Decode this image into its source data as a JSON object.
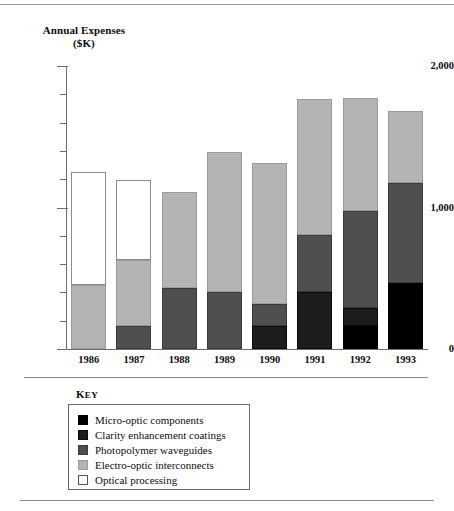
{
  "chart_data": {
    "type": "bar",
    "subtype": "stacked",
    "title": "Annual Expenses",
    "title_line2": "($K)",
    "ylabel": "Annual Expenses ($K)",
    "xlabel": "",
    "categories": [
      "1986",
      "1987",
      "1988",
      "1989",
      "1990",
      "1991",
      "1992",
      "1993"
    ],
    "ylim": [
      0,
      2000
    ],
    "ytick_labels": [
      "0",
      "1,000",
      "2,000"
    ],
    "ytick_values": [
      0,
      1000,
      2000
    ],
    "yminor_step": 200,
    "grid": false,
    "legend_position": "below-chart",
    "legend_title": "Key",
    "series": [
      {
        "name": "Optical processing",
        "color": "#ffffff",
        "values": [
          800,
          565,
          0,
          0,
          0,
          0,
          0,
          0
        ]
      },
      {
        "name": "Electro-optic interconnects",
        "color": "#b4b4b4",
        "values": [
          450,
          470,
          680,
          995,
          995,
          965,
          800,
          510
        ]
      },
      {
        "name": "Photopolymer waveguides",
        "color": "#4f4f4f",
        "values": [
          0,
          160,
          430,
          400,
          155,
          405,
          685,
          705
        ]
      },
      {
        "name": "Clarity enhancement coatings",
        "color": "#1c1c1c",
        "values": [
          0,
          0,
          0,
          0,
          165,
          400,
          130,
          0
        ]
      },
      {
        "name": "Micro-optic components",
        "color": "#000000",
        "values": [
          0,
          0,
          0,
          0,
          0,
          0,
          160,
          470
        ]
      }
    ],
    "totals": [
      1250,
      1195,
      1110,
      1395,
      1315,
      1770,
      1775,
      1685
    ]
  },
  "legend": {
    "title": "Key",
    "title_first": "K",
    "title_rest": "EY",
    "entries": [
      {
        "label": "Micro-optic components",
        "swatch": "micro"
      },
      {
        "label": "Clarity enhancement coatings",
        "swatch": "clarity"
      },
      {
        "label": "Photopolymer waveguides",
        "swatch": "photo"
      },
      {
        "label": "Electro-optic interconnects",
        "swatch": "electro"
      },
      {
        "label": "Optical processing",
        "swatch": "optical"
      }
    ]
  }
}
